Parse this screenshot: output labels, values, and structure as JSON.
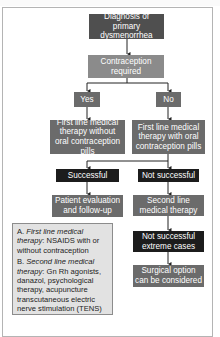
{
  "flowchart": {
    "diagnosis": "Diagnosis of primary dysmenorrhea",
    "contraception": "Contraception required",
    "yes": "Yes",
    "no": "No",
    "first_line_without": "First line medical therapy without oral contraception pills",
    "first_line_with": "First line medical therapy with oral contraception pills",
    "successful": "Successful",
    "not_successful": "Not successful",
    "patient_eval": "Patient evaluation and follow-up",
    "second_line": "Second line medical therapy",
    "extreme_cases": "Not successful extreme cases",
    "surgical": "Surgical option can be considered"
  },
  "legend": {
    "a_prefix": "A. ",
    "a_term": "First line medical therapy",
    "a_text": ": NSAIDS with or without contraception",
    "b_prefix": "B. ",
    "b_term": "Second line medical therapy",
    "b_text": ": Gn Rh agonists, danazol, psychological therapy, acupuncture transcutaneous electric nerve stimulation (TENS)"
  },
  "colors": {
    "dark_box": "#4f4f4f",
    "light_box": "#8b8b8b",
    "mid_box": "#6b6b6b",
    "black_box": "#1c1c1c",
    "legend_bg": "#e2e2e2"
  }
}
